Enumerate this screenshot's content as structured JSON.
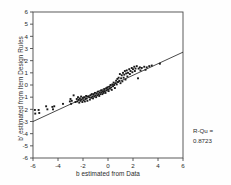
{
  "chart_data": {
    "type": "scatter",
    "title": "",
    "xlabel": "b estimated from Data",
    "ylabel": "b' estimated from Item Design Rules",
    "xlim": [
      -6,
      6
    ],
    "ylim": [
      -6,
      6
    ],
    "xticks": [
      -6,
      -4,
      -2,
      0,
      2,
      4,
      6
    ],
    "yticks": [
      -6,
      -5,
      -4,
      -3,
      -2,
      -1,
      0,
      1,
      2,
      3,
      4,
      5,
      6
    ],
    "xtick_labels": [
      "-6",
      "-4",
      "-2",
      "0",
      "2",
      "4",
      "6"
    ],
    "ytick_labels": [
      "-6",
      "-5",
      "-4",
      "-3",
      "-2",
      "-1",
      "0",
      "1",
      "2",
      "3",
      "4",
      "5",
      "6"
    ],
    "grid": false,
    "legend": null,
    "marker": "square",
    "marker_color": "#1a1a1a",
    "line_color": "#1a1a1a",
    "annotations": [
      {
        "label": "R-Qu =",
        "value": "0.8723"
      }
    ],
    "fit_line": {
      "type": "linear",
      "slope": 0.475,
      "intercept": -0.15,
      "x_start": -6,
      "x_end": 6,
      "y_start": -3.0,
      "y_end": 2.7
    },
    "points": [
      [
        -5.85,
        -2.05
      ],
      [
        -5.82,
        -2.35
      ],
      [
        -5.55,
        -2.05
      ],
      [
        -5.5,
        -2.3
      ],
      [
        -4.95,
        -1.75
      ],
      [
        -4.85,
        -2.0
      ],
      [
        -4.45,
        -1.8
      ],
      [
        -4.4,
        -2.0
      ],
      [
        -4.3,
        -1.75
      ],
      [
        -3.6,
        -1.55
      ],
      [
        -3.05,
        -1.35
      ],
      [
        -3.0,
        -1.15
      ],
      [
        -2.95,
        -1.55
      ],
      [
        -2.9,
        -1.3
      ],
      [
        -2.75,
        -0.85
      ],
      [
        -2.6,
        -1.4
      ],
      [
        -2.5,
        -1.15
      ],
      [
        -2.45,
        -1.35
      ],
      [
        -2.4,
        -1.0
      ],
      [
        -2.35,
        -1.2
      ],
      [
        -2.3,
        -1.45
      ],
      [
        -2.25,
        -1.1
      ],
      [
        -2.2,
        -1.3
      ],
      [
        -2.15,
        -0.95
      ],
      [
        -2.1,
        -1.2
      ],
      [
        -2.05,
        -1.4
      ],
      [
        -2.0,
        -1.05
      ],
      [
        -1.95,
        -1.25
      ],
      [
        -1.9,
        -1.0
      ],
      [
        -1.85,
        -1.35
      ],
      [
        -1.8,
        -1.15
      ],
      [
        -1.75,
        -0.9
      ],
      [
        -1.7,
        -1.1
      ],
      [
        -1.65,
        -1.3
      ],
      [
        -1.6,
        -0.95
      ],
      [
        -1.5,
        -1.0
      ],
      [
        -1.45,
        -1.2
      ],
      [
        -1.4,
        -0.85
      ],
      [
        -1.35,
        -1.05
      ],
      [
        -1.3,
        -0.75
      ],
      [
        -1.25,
        -0.95
      ],
      [
        -1.2,
        -1.1
      ],
      [
        -1.15,
        -0.8
      ],
      [
        -1.1,
        -0.95
      ],
      [
        -1.05,
        -0.65
      ],
      [
        -1.0,
        -0.85
      ],
      [
        -0.95,
        -1.0
      ],
      [
        -0.9,
        -0.7
      ],
      [
        -0.85,
        -0.85
      ],
      [
        -0.8,
        -0.55
      ],
      [
        -0.75,
        -0.75
      ],
      [
        -0.7,
        -0.9
      ],
      [
        -0.65,
        -0.6
      ],
      [
        -0.6,
        -0.75
      ],
      [
        -0.55,
        -0.45
      ],
      [
        -0.5,
        -0.6
      ],
      [
        -0.45,
        -0.75
      ],
      [
        -0.4,
        -0.5
      ],
      [
        -0.35,
        -0.65
      ],
      [
        -0.3,
        -0.35
      ],
      [
        -0.25,
        -0.5
      ],
      [
        -0.2,
        -0.65
      ],
      [
        -0.15,
        -0.3
      ],
      [
        -0.1,
        -0.45
      ],
      [
        -0.05,
        -0.2
      ],
      [
        0.0,
        -0.35
      ],
      [
        0.05,
        -0.5
      ],
      [
        0.1,
        -0.15
      ],
      [
        0.15,
        -0.3
      ],
      [
        0.2,
        0.0
      ],
      [
        0.25,
        -0.2
      ],
      [
        0.3,
        -0.4
      ],
      [
        0.35,
        0.05
      ],
      [
        0.4,
        -0.1
      ],
      [
        0.45,
        0.2
      ],
      [
        0.5,
        0.0
      ],
      [
        0.55,
        -0.25
      ],
      [
        0.6,
        0.15
      ],
      [
        0.65,
        0.35
      ],
      [
        0.7,
        0.05
      ],
      [
        0.75,
        0.5
      ],
      [
        0.8,
        0.25
      ],
      [
        0.85,
        0.6
      ],
      [
        0.9,
        0.35
      ],
      [
        0.95,
        0.9
      ],
      [
        1.0,
        0.15
      ],
      [
        1.05,
        0.55
      ],
      [
        1.1,
        0.8
      ],
      [
        1.15,
        0.3
      ],
      [
        1.2,
        1.0
      ],
      [
        1.25,
        0.6
      ],
      [
        1.3,
        0.85
      ],
      [
        1.35,
        1.15
      ],
      [
        1.4,
        0.45
      ],
      [
        1.45,
        0.95
      ],
      [
        1.5,
        1.2
      ],
      [
        1.55,
        0.7
      ],
      [
        1.6,
        1.0
      ],
      [
        1.7,
        1.3
      ],
      [
        1.75,
        0.9
      ],
      [
        1.8,
        1.15
      ],
      [
        1.9,
        1.4
      ],
      [
        1.95,
        1.05
      ],
      [
        2.0,
        1.3
      ],
      [
        2.1,
        1.5
      ],
      [
        2.15,
        1.15
      ],
      [
        2.2,
        1.35
      ],
      [
        2.3,
        1.55
      ],
      [
        2.4,
        0.55
      ],
      [
        2.45,
        1.35
      ],
      [
        2.55,
        1.45
      ],
      [
        2.6,
        1.2
      ],
      [
        2.7,
        1.4
      ],
      [
        2.9,
        1.5
      ],
      [
        3.0,
        1.25
      ],
      [
        3.1,
        1.45
      ],
      [
        3.3,
        1.55
      ],
      [
        3.5,
        1.6
      ],
      [
        4.15,
        1.75
      ]
    ]
  }
}
